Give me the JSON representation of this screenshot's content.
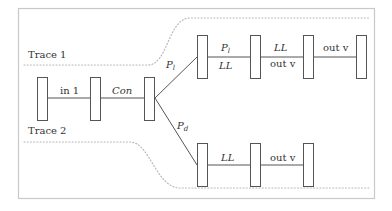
{
  "diagram": {
    "traces": [
      {
        "label": "Trace 1"
      },
      {
        "label": "Trace 2"
      }
    ],
    "shared_path": {
      "edges": [
        {
          "label": "in 1",
          "italic": false
        },
        {
          "label": "Con",
          "italic": true
        }
      ]
    },
    "branch_labels": {
      "upper": {
        "base": "P",
        "sub": "l"
      },
      "lower": {
        "base": "P",
        "sub": "d"
      }
    },
    "upper_path": {
      "edges": [
        {
          "top": {
            "base": "P",
            "sub": "l"
          },
          "bottom": "LL"
        },
        {
          "top": "LL",
          "bottom": "out v"
        },
        {
          "top": "out v"
        }
      ]
    },
    "lower_path": {
      "edges": [
        {
          "top": "LL"
        },
        {
          "top": "out v"
        }
      ]
    },
    "colors": {
      "frame": "#c8c8c8",
      "stroke": "#555555",
      "dotted": "#b8b8b8",
      "text": "#333333"
    }
  }
}
